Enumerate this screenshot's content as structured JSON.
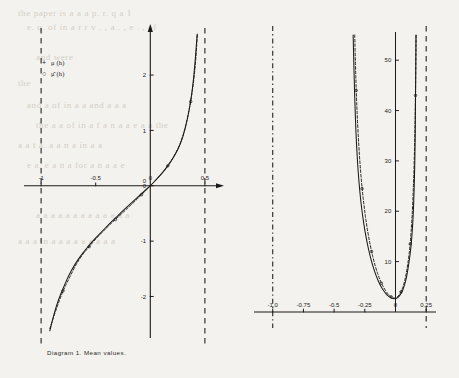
{
  "page": {
    "background": "#f4f2ee",
    "ink": "#1a1a1a",
    "bleed_through_lines": [
      "the paper is a a a p. r. q a 1",
      "e. q. of in a r  r v . , a . ,  e . , of",
      "and were",
      "the",
      "and a of in a a and a a a",
      "the a a of in a f a n a a e a a the",
      "a a t a. a  a  n   a in a a ",
      "e a. e a n a  for  a n a a e",
      "a a a a a a a a   a a  a a a",
      "a a a in a a a  a a a  a a a"
    ]
  },
  "figures": [
    {
      "id": "diagram-1",
      "caption": "Diagram 1. Mean values.",
      "legend": [
        {
          "marker": "+",
          "label": "μ (h)",
          "hat": false,
          "squared": false
        },
        {
          "marker": "○",
          "label": "μ̂ (h)",
          "hat": true,
          "squared": false
        }
      ]
    },
    {
      "id": "diagram-2",
      "caption": "Diagram 2. Variances.",
      "legend": [
        {
          "marker": "+",
          "label": "σ² (h)",
          "hat": false,
          "squared": true
        },
        {
          "marker": "○",
          "label": "σ̂² (h)",
          "hat": true,
          "squared": true
        }
      ]
    }
  ],
  "chart_data": [
    {
      "type": "line",
      "id": "diagram-1",
      "title": "Diagram 1. Mean values.",
      "xlabel": "h",
      "ylabel": "",
      "xlim": [
        -1.12,
        0.62
      ],
      "ylim": [
        -2.75,
        2.85
      ],
      "grid": false,
      "legend_position": "upper-left",
      "xticks": [
        -1,
        -0.5,
        0,
        0.5
      ],
      "xticklabels": [
        "-1",
        "-0.5",
        "0",
        "0.5"
      ],
      "yticks": [
        -2,
        -1,
        0,
        1,
        2
      ],
      "yticklabels": [
        "-2",
        "-1",
        "0",
        "1",
        "2"
      ],
      "asymptotes": [
        {
          "x": -1.0,
          "style": "dashed"
        },
        {
          "x": 0.5,
          "style": "dashed"
        }
      ],
      "series": [
        {
          "name": "μ (h)",
          "style": "solid",
          "marker": "+",
          "x": [
            -0.92,
            -0.88,
            -0.84,
            -0.8,
            -0.75,
            -0.7,
            -0.65,
            -0.6,
            -0.55,
            -0.5,
            -0.45,
            -0.4,
            -0.35,
            -0.3,
            -0.25,
            -0.2,
            -0.15,
            -0.1,
            -0.05,
            0.0,
            0.05,
            0.1,
            0.15,
            0.2,
            0.25,
            0.3,
            0.34,
            0.37,
            0.39,
            0.41,
            0.42,
            0.43
          ],
          "y": [
            -2.62,
            -2.3,
            -2.05,
            -1.86,
            -1.63,
            -1.45,
            -1.3,
            -1.17,
            -1.05,
            -0.94,
            -0.84,
            -0.74,
            -0.64,
            -0.55,
            -0.45,
            -0.36,
            -0.27,
            -0.18,
            -0.09,
            0.0,
            0.1,
            0.21,
            0.33,
            0.47,
            0.64,
            0.88,
            1.2,
            1.52,
            1.82,
            2.22,
            2.5,
            2.74
          ]
        },
        {
          "name": "μ̂ (h)",
          "style": "dashed",
          "marker": "o",
          "x": [
            -0.92,
            -0.86,
            -0.8,
            -0.74,
            -0.68,
            -0.62,
            -0.56,
            -0.5,
            -0.44,
            -0.38,
            -0.32,
            -0.26,
            -0.2,
            -0.14,
            -0.08,
            -0.02,
            0.04,
            0.1,
            0.16,
            0.22,
            0.28,
            0.33,
            0.37,
            0.4,
            0.42,
            0.43
          ],
          "y": [
            -2.58,
            -2.22,
            -1.9,
            -1.66,
            -1.42,
            -1.24,
            -1.1,
            -0.96,
            -0.84,
            -0.72,
            -0.61,
            -0.5,
            -0.39,
            -0.28,
            -0.16,
            -0.04,
            0.08,
            0.21,
            0.36,
            0.54,
            0.78,
            1.12,
            1.52,
            1.92,
            2.36,
            2.72
          ]
        }
      ]
    },
    {
      "type": "line",
      "id": "diagram-2",
      "title": "Diagram 2. Variances.",
      "xlabel": "h",
      "ylabel": "",
      "xlim": [
        -1.12,
        0.33
      ],
      "ylim": [
        -2,
        56
      ],
      "grid": false,
      "legend_position": "center-left",
      "xticks": [
        -1.0,
        -0.75,
        -0.5,
        -0.25,
        0,
        0.25
      ],
      "xticklabels": [
        "-1.0",
        "-0.75",
        "-0.5",
        "-0.25",
        "0",
        "0.25"
      ],
      "yticks": [
        10,
        20,
        30,
        40,
        50
      ],
      "yticklabels": [
        "10",
        "20",
        "30",
        "40",
        "50"
      ],
      "asymptotes": [
        {
          "x": -1.0,
          "style": "dash-dot"
        },
        {
          "x": 0.25,
          "style": "dashed"
        }
      ],
      "series": [
        {
          "name": "σ² (h)",
          "style": "solid",
          "marker": "+",
          "x": [
            -0.345,
            -0.34,
            -0.335,
            -0.33,
            -0.325,
            -0.32,
            -0.31,
            -0.3,
            -0.285,
            -0.27,
            -0.25,
            -0.23,
            -0.21,
            -0.19,
            -0.17,
            -0.15,
            -0.13,
            -0.11,
            -0.09,
            -0.07,
            -0.05,
            -0.03,
            -0.01,
            0.01,
            0.03,
            0.05,
            0.07,
            0.09,
            0.11,
            0.125,
            0.14,
            0.15,
            0.158,
            0.163,
            0.167
          ],
          "y": [
            55.0,
            50.0,
            45.0,
            41.0,
            37.5,
            34.5,
            30.0,
            26.5,
            22.5,
            19.5,
            16.2,
            13.6,
            11.4,
            9.6,
            8.0,
            6.7,
            5.6,
            4.7,
            4.0,
            3.4,
            3.0,
            2.7,
            2.6,
            2.7,
            3.1,
            3.8,
            5.0,
            6.8,
            9.8,
            12.5,
            17.0,
            22.5,
            30.0,
            40.0,
            55.0
          ]
        },
        {
          "name": "σ̂² (h)",
          "style": "dashed",
          "marker": "o",
          "x": [
            -0.332,
            -0.326,
            -0.32,
            -0.312,
            -0.3,
            -0.288,
            -0.272,
            -0.255,
            -0.235,
            -0.215,
            -0.195,
            -0.175,
            -0.155,
            -0.135,
            -0.115,
            -0.095,
            -0.075,
            -0.055,
            -0.035,
            -0.015,
            0.005,
            0.025,
            0.045,
            0.065,
            0.085,
            0.105,
            0.12,
            0.135,
            0.148,
            0.157,
            0.163,
            0.168
          ],
          "y": [
            55.0,
            49.0,
            44.0,
            39.0,
            33.5,
            29.0,
            24.5,
            20.8,
            17.2,
            14.4,
            12.0,
            10.0,
            8.3,
            6.9,
            5.7,
            4.8,
            4.0,
            3.4,
            3.0,
            2.7,
            2.8,
            3.2,
            4.0,
            5.2,
            7.2,
            10.2,
            13.5,
            18.5,
            26.0,
            34.0,
            43.0,
            55.0
          ]
        }
      ]
    }
  ]
}
